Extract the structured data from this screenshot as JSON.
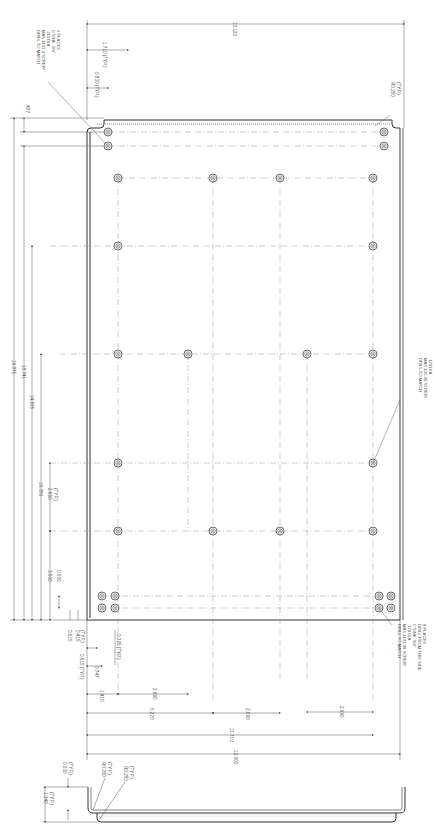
{
  "drawing": {
    "title": "Sheet-metal panel with mounting hole pattern",
    "orientation": "rotated 90 degrees"
  },
  "overall_dimensions": {
    "width_top": "13.120",
    "height_total": "19.875",
    "height_to_upper_holes": "18.741",
    "height_14": "14.875",
    "height_10": "10.380",
    "height_3_5": "3.500",
    "height_0_5": "0.500",
    "top_gap": ".437",
    "row_spacing": "2.690",
    "row_spacing_note": "(TYP.)",
    "width_bottom": "12.000",
    "width_11": "11.710",
    "width_5": "5.270",
    "col_spacing_1": "2.690",
    "col_spacing_2": "2.690",
    "col_spacing_3": "2.690",
    "width_1_4": "1.410"
  },
  "top_dimensions": {
    "d1": "1.710",
    "d1_note": "(TYP.)",
    "d2": "0.830",
    "d2_note": "(TYP.)",
    "radius": "R0.250",
    "radius_note": "(TYP.)"
  },
  "corner_dimensions": {
    "a": "0.615",
    "b": "0.415",
    "b_note": "(TYP.)",
    "c": "0.615",
    "c_note": "(TYP.)",
    "d": "0.747",
    "e": "0.375",
    "e_note": "(TYP.)"
  },
  "notes": {
    "top_left": [
      "DRILL TO MATCH",
      "MAS 1102-3 SCREW",
      ".213 DIA",
      "C'SINK .007",
      "4 PLACES"
    ],
    "right_middle": [
      "DRILL TO MATCH",
      "MAS 102-08 SCREW",
      ".170 DIA"
    ],
    "bottom_right": [
      "DRILL TO MATCH",
      "MAS 1102-08 SCREW",
      ".170 DIA",
      "C'SINK .007",
      "DRILL FROM THIS SIDE",
      "8 PLACES"
    ]
  },
  "section_view": {
    "height": "1.340",
    "height_note": "(TYP.)",
    "thickness": "0.030",
    "thickness_note": "(TYP.)",
    "inner_radius": "R0.200",
    "inner_radius_note": "(TYP.)",
    "outer_radius": "R0.250",
    "outer_radius_note": "(TYP.)"
  }
}
